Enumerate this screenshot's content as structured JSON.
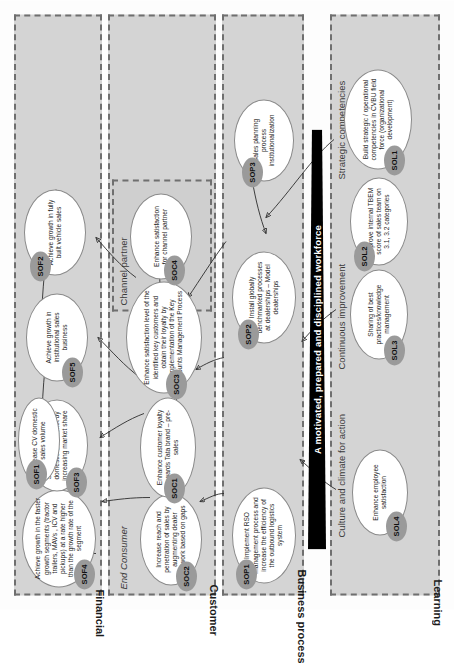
{
  "diagram": {
    "banner": "A motivated, prepared and disciplined workforce",
    "perspectives": [
      {
        "id": "financial",
        "label": "Financial"
      },
      {
        "id": "customer",
        "label": "Customer"
      },
      {
        "id": "business_process",
        "label": "Business process"
      },
      {
        "id": "learning",
        "label": "Learning"
      }
    ],
    "sub_labels": [
      {
        "id": "channel_partner",
        "label": "Channel partner"
      },
      {
        "id": "end_consumer",
        "label": "End Consumer"
      },
      {
        "id": "strategic_competencies",
        "label": "Strategic competencies"
      },
      {
        "id": "continuous_improvement",
        "label": "Continuous improvement"
      },
      {
        "id": "culture_climate",
        "label": "Culture and climate for action"
      }
    ],
    "objectives": [
      {
        "code": "SOF1",
        "perspective": "Financial",
        "text": "Increase CV domestic sales volume"
      },
      {
        "code": "SOF2",
        "perspective": "Financial",
        "text": "Achieve growth in fully built vehicle sales"
      },
      {
        "code": "SOF3",
        "perspective": "Financial",
        "text": "Strengthen presence in domestic CV market by increasing market share"
      },
      {
        "code": "SOF4",
        "perspective": "Financial",
        "text": "Achieve growth in the faster growth segments (tractor trailers, MAVs , ICV and pickups) at a rate higher than the growth rate of the segment"
      },
      {
        "code": "SOF5",
        "perspective": "Financial",
        "text": "Achieve growth in institutional sales business"
      },
      {
        "code": "SOC1",
        "perspective": "Customer",
        "text": "Enhance customer loyalty towards Tata brand – pre-sales"
      },
      {
        "code": "SOC2",
        "perspective": "Customer",
        "text": "Increase reach and penetration of sales by augmenting dealer network based on gaps"
      },
      {
        "code": "SOC3",
        "perspective": "Customer",
        "text": "Enhance satisfaction level of the identified key customers and obtain their loyalty by implementation of the Key Accounts Management Process"
      },
      {
        "code": "SOC4",
        "perspective": "Customer",
        "text": "Enhance satisfaction for channel partner"
      },
      {
        "code": "SOP1",
        "perspective": "Business process",
        "text": "Implement RSO management process and increase the efficiency of the outbound logistics system"
      },
      {
        "code": "SOP2",
        "perspective": "Business process",
        "text": "Install globally benchmarked processes at dealerships – Model dealerships"
      },
      {
        "code": "SOP3",
        "perspective": "Business process",
        "text": "Sales planning process institutionalization"
      },
      {
        "code": "SOL1",
        "perspective": "Learning",
        "text": "Build strategic / operational competencies in CVBU field force (organizational development)"
      },
      {
        "code": "SOL2",
        "perspective": "Learning",
        "text": "Improve internal TBEM score of sales team on 3.1, 3.2 categories"
      },
      {
        "code": "SOL3",
        "perspective": "Learning",
        "text": "Sharing of best practices/knowledge management"
      },
      {
        "code": "SOL4",
        "perspective": "Learning",
        "text": "Enhance employee satisfaction"
      }
    ],
    "colors": {
      "band_background": "#d4d4d4",
      "band_border": "#6f6f6f",
      "node_fill": "#ffffff",
      "badge_fill": "#9a9a9a",
      "banner_background": "#000000",
      "banner_text": "#ffffff",
      "link_stroke": "#2c2c2c"
    }
  }
}
